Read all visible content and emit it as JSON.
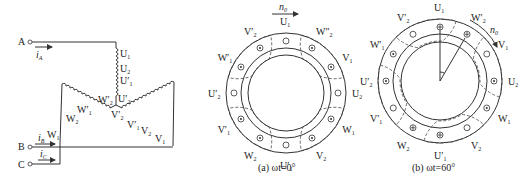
{
  "schematic": {
    "terminals": [
      "A",
      "B",
      "C"
    ],
    "currents": [
      {
        "name": "i",
        "sub": "A"
      },
      {
        "name": "i",
        "sub": "B"
      },
      {
        "name": "i",
        "sub": "C"
      }
    ],
    "u_labels": [
      {
        "t": "U",
        "s": "1"
      },
      {
        "t": "U",
        "s": "2"
      },
      {
        "t": "U′",
        "s": "1"
      },
      {
        "t": "U′",
        "s": "2"
      }
    ],
    "w_labels": [
      {
        "t": "W′",
        "s": "2"
      },
      {
        "t": "W′",
        "s": "1"
      },
      {
        "t": "W",
        "s": "2"
      },
      {
        "t": "W",
        "s": "1"
      }
    ],
    "v_labels": [
      {
        "t": "V′",
        "s": "2"
      },
      {
        "t": "V′",
        "s": "1"
      },
      {
        "t": "V",
        "s": "2"
      },
      {
        "t": "V",
        "s": "1"
      }
    ]
  },
  "diagram_a": {
    "caption": "(a) ωt=0°",
    "speed_label": {
      "t": "n",
      "s": "0"
    },
    "slot_labels": [
      {
        "t": "U",
        "s": "1"
      },
      {
        "t": "W″",
        "s": "2"
      },
      {
        "t": "V",
        "s": "1"
      },
      {
        "t": "U",
        "s": "2"
      },
      {
        "t": "W",
        "s": "1"
      },
      {
        "t": "V",
        "s": "2"
      },
      {
        "t": "U′",
        "s": "1"
      },
      {
        "t": "W",
        "s": "2"
      },
      {
        "t": "V′",
        "s": "1"
      },
      {
        "t": "U′",
        "s": "2"
      },
      {
        "t": "W′",
        "s": "1"
      },
      {
        "t": "V′",
        "s": "2"
      }
    ]
  },
  "diagram_b": {
    "caption": "(b) ωt=60°",
    "speed_label": {
      "t": "n",
      "s": "0"
    },
    "angle_deg": 60,
    "slot_labels": [
      {
        "t": "U",
        "s": "1"
      },
      {
        "t": "W′",
        "s": "2"
      },
      {
        "t": "V",
        "s": "1"
      },
      {
        "t": "U",
        "s": "2"
      },
      {
        "t": "W",
        "s": "1"
      },
      {
        "t": "V",
        "s": "2"
      },
      {
        "t": "U′",
        "s": "1"
      },
      {
        "t": "W",
        "s": "2"
      },
      {
        "t": "V′",
        "s": "1"
      },
      {
        "t": "U′",
        "s": "2"
      },
      {
        "t": "W′",
        "s": "1"
      },
      {
        "t": "V′",
        "s": "2"
      }
    ]
  }
}
